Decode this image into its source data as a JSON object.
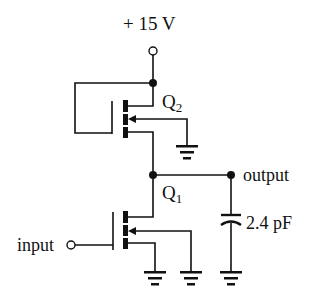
{
  "diagram": {
    "supply": {
      "label": "+ 15 V"
    },
    "transistors": [
      {
        "id": "Q2",
        "label": "Q",
        "subscript": "2",
        "role": "load (gate tied to drain)"
      },
      {
        "id": "Q1",
        "label": "Q",
        "subscript": "1",
        "role": "driver"
      }
    ],
    "nodes": {
      "output": {
        "label": "output"
      },
      "input": {
        "label": "input"
      }
    },
    "capacitor": {
      "label": "2.4 pF"
    },
    "grounds": 4,
    "colors": {
      "stroke": "#111111",
      "background": "#ffffff"
    }
  }
}
